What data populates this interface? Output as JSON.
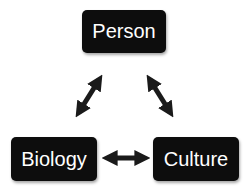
{
  "diagram": {
    "nodes": [
      {
        "id": "person",
        "label": "Person"
      },
      {
        "id": "biology",
        "label": "Biology"
      },
      {
        "id": "culture",
        "label": "Culture"
      }
    ],
    "edges": [
      {
        "from": "person",
        "to": "biology",
        "type": "bidirectional-arrow"
      },
      {
        "from": "person",
        "to": "culture",
        "type": "bidirectional-arrow"
      },
      {
        "from": "biology",
        "to": "culture",
        "type": "bidirectional-arrow"
      }
    ],
    "colors": {
      "node_fill": "#0d0d0d",
      "node_text": "#ffffff",
      "arrow": "#1a1a1a",
      "background": "#ffffff"
    }
  }
}
